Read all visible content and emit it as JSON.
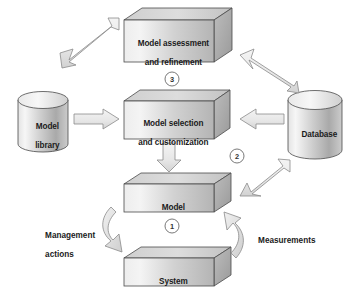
{
  "diagram": {
    "background_color": "#ffffff",
    "stroke_color": "#3a3a3a",
    "arrow_fill": "#e9e9e9",
    "arrow_stroke": "#7d7d7d",
    "box_face_light": "#f2f2f2",
    "box_face_dark": "#b9b9b9",
    "box_top_color": "#d6d6d6",
    "box_side_color": "#a8a8a8",
    "text_color": "#1b1b1b",
    "nodes": [
      {
        "id": "model-assessment",
        "shape": "3d-box",
        "label": "Model assessment\nand refinement",
        "line1": "Model assessment",
        "line2": "and refinement"
      },
      {
        "id": "model-library",
        "shape": "cylinder",
        "label": "Model\nlibrary",
        "line1": "Model",
        "line2": "library"
      },
      {
        "id": "model-selection",
        "shape": "3d-box",
        "label": "Model selection\nand customization",
        "line1": "Model selection",
        "line2": "and customization"
      },
      {
        "id": "database",
        "shape": "cylinder",
        "label": "Database",
        "line1": "Database",
        "line2": ""
      },
      {
        "id": "model",
        "shape": "3d-box",
        "label": "Model",
        "line1": "Model",
        "line2": ""
      },
      {
        "id": "system",
        "shape": "3d-box",
        "label": "System",
        "line1": "System",
        "line2": ""
      }
    ],
    "side_labels": [
      {
        "id": "management-actions",
        "line1": "Management",
        "line2": "actions"
      },
      {
        "id": "measurements",
        "line1": "Measurements",
        "line2": ""
      }
    ],
    "step_markers": [
      {
        "id": "step-1",
        "number": "1"
      },
      {
        "id": "step-2",
        "number": "2"
      },
      {
        "id": "step-3",
        "number": "3"
      }
    ],
    "connectors": [
      {
        "id": "library-to-assessment",
        "heads": "double",
        "style": "straight-diagonal"
      },
      {
        "id": "database-to-assessment",
        "heads": "single",
        "style": "straight-diagonal"
      },
      {
        "id": "library-to-selection",
        "heads": "single",
        "style": "straight-horizontal"
      },
      {
        "id": "database-to-selection",
        "heads": "single",
        "style": "straight-horizontal"
      },
      {
        "id": "selection-to-model",
        "heads": "single",
        "style": "straight-vertical"
      },
      {
        "id": "model-to-database",
        "heads": "double",
        "style": "straight-diagonal"
      },
      {
        "id": "model-to-system",
        "heads": "single",
        "style": "curved"
      },
      {
        "id": "system-to-model",
        "heads": "single",
        "style": "curved"
      }
    ]
  }
}
